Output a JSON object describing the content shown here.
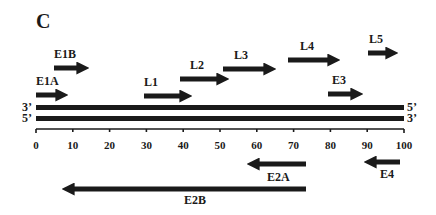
{
  "panel": {
    "label": "C"
  },
  "strands": {
    "top": {
      "left_end": "3’",
      "right_end": "5’"
    },
    "bottom": {
      "left_end": "5’",
      "right_end": "3’"
    }
  },
  "axis": {
    "min": 0,
    "max": 100,
    "ticks": [
      "0",
      "10",
      "20",
      "30",
      "40",
      "50",
      "60",
      "70",
      "80",
      "90",
      "100"
    ]
  },
  "genes": {
    "rightward": [
      {
        "name": "E1A",
        "start": 0,
        "end": 8
      },
      {
        "name": "E1B",
        "start": 5,
        "end": 14
      },
      {
        "name": "L1",
        "start": 29.5,
        "end": 42
      },
      {
        "name": "L2",
        "start": 39,
        "end": 52
      },
      {
        "name": "L3",
        "start": 51,
        "end": 65
      },
      {
        "name": "L4",
        "start": 68.5,
        "end": 82.5
      },
      {
        "name": "L5",
        "start": 90,
        "end": 98
      },
      {
        "name": "E3",
        "start": 79.5,
        "end": 89
      }
    ],
    "leftward": [
      {
        "name": "E2A",
        "start": 73.5,
        "end": 58
      },
      {
        "name": "E4",
        "start": 99,
        "end": 89.5
      },
      {
        "name": "E2B",
        "start": 73.5,
        "end": 7.5
      }
    ]
  },
  "colors": {
    "ink": "#1a1a1a",
    "background": "#ffffff"
  }
}
